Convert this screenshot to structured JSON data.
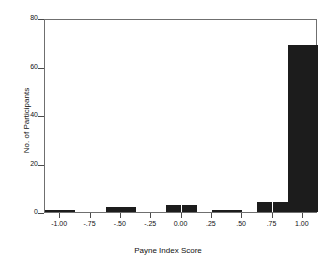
{
  "chart_data": {
    "type": "bar",
    "title": "",
    "subtitle": "",
    "xlabel": "Payne Index Score",
    "ylabel": "No. of Participants",
    "xlim": [
      -1.125,
      1.125
    ],
    "ylim": [
      0,
      80
    ],
    "grid": false,
    "legend": null,
    "xtick_labels": [
      "-1.00",
      "-.75",
      "-.50",
      "-.25",
      "0.00",
      ".25",
      ".50",
      ".75",
      "1.00"
    ],
    "xtick_values": [
      -1.0,
      -0.75,
      -0.5,
      -0.25,
      0.0,
      0.25,
      0.5,
      0.75,
      1.0
    ],
    "ytick_labels": [
      "0",
      "20",
      "40",
      "60",
      "80"
    ],
    "ytick_values": [
      0,
      20,
      40,
      60,
      80
    ],
    "bin_width": 0.125,
    "bin_centers": [
      -1.0625,
      -0.9375,
      -0.8125,
      -0.6875,
      -0.5625,
      -0.4375,
      -0.3125,
      -0.1875,
      -0.0625,
      0.0625,
      0.1875,
      0.3125,
      0.4375,
      0.5625,
      0.6875,
      0.8125,
      0.9375,
      1.0625
    ],
    "categories": [
      "-1.06",
      "-0.94",
      "-0.81",
      "-0.69",
      "-0.56",
      "-0.44",
      "-0.31",
      "-0.19",
      "-0.06",
      "0.06",
      "0.19",
      "0.31",
      "0.44",
      "0.56",
      "0.69",
      "0.81",
      "0.94",
      "1.06"
    ],
    "values": [
      1,
      1,
      0,
      0,
      2,
      2,
      0,
      0,
      3,
      3,
      0,
      1,
      1,
      0,
      4,
      4,
      69,
      69
    ],
    "bar_color": "#1c1c1c",
    "frame_color": "#6f6f6f",
    "background": "#ffffff"
  }
}
